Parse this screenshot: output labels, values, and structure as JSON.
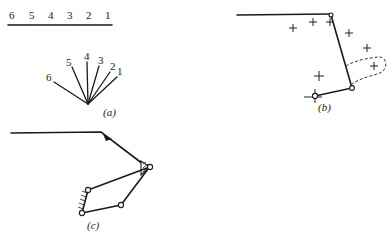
{
  "panel_a": {
    "caption": "(a)",
    "scale_labels": [
      "6",
      "5",
      "4",
      "3",
      "2",
      "1"
    ],
    "fan_labels": [
      "6",
      "5",
      "4",
      "3",
      "2",
      "1"
    ]
  },
  "panel_b": {
    "caption": "(b)"
  },
  "panel_c": {
    "caption": "(c)"
  }
}
